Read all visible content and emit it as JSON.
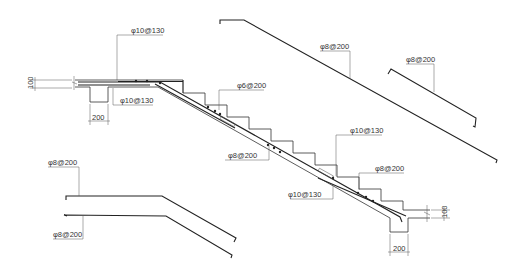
{
  "drawing": {
    "title": "Stair reinforcement section",
    "labels": {
      "top_landing_top_bar": "φ10@130",
      "top_landing_bottom_bar": "φ10@130",
      "upper_distribution": "φ6@200",
      "slab_distribution": "φ8@200",
      "lower_top_bar": "φ10@130",
      "lower_bottom_bar": "φ10@130",
      "lower_distribution": "φ8@200",
      "detail_long_bar": "φ8@200",
      "detail_short_bar": "φ8@200",
      "detail_bent_top": "φ8@200",
      "detail_bent_bottom": "φ8@200"
    },
    "dimensions": {
      "left_thickness": "100",
      "left_beam_width": "200",
      "right_thickness": "100",
      "right_beam_width": "200"
    }
  }
}
